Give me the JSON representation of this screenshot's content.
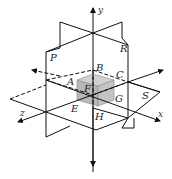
{
  "diagram": {
    "colors": {
      "line": "#111111",
      "cube_fill": "#b8b8b8",
      "cube_top": "#cfcfcf",
      "background": "#ffffff"
    },
    "axes": {
      "y": "y",
      "x": "x",
      "z": "z"
    },
    "planes": {
      "P": "P",
      "R": "R",
      "S": "S"
    },
    "points": {
      "A": "A",
      "B": "B",
      "C": "C",
      "E": "E",
      "F": "F",
      "G": "G",
      "H": "H"
    }
  }
}
